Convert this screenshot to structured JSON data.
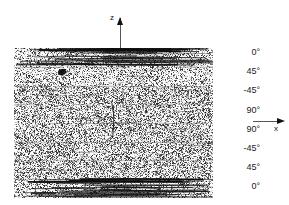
{
  "figure": {
    "kind": "optical-micrograph",
    "background_color": "#ffffff",
    "ink_color": "#111111"
  },
  "micrograph": {
    "left": 14,
    "top": 48,
    "width": 199,
    "height": 150,
    "description": "Speckled cross-section of a fibre-reinforced laminate showing stacked plies; dark horizontal fibre streaks in the outer 0-degree bands, fine random speckle through the interior, faint horizontal ply interfaces, a vertical transverse crack near the centre and a dark void near the upper left.",
    "features": [
      {
        "name": "void-upper-left",
        "x": 62,
        "y": 72,
        "width": 8,
        "height": 6
      },
      {
        "name": "transverse-crack",
        "x": 112,
        "y": 103,
        "width": 2,
        "height": 34
      },
      {
        "name": "micro-crack-lower-centre",
        "x": 130,
        "y": 127,
        "width": 2,
        "height": 8
      }
    ],
    "ply_interfaces_y": [
      0,
      19,
      38,
      56,
      75,
      94,
      112,
      131,
      150
    ],
    "fibre_band_rows": [
      0,
      1,
      7
    ]
  },
  "ply_labels": {
    "items": [
      {
        "label": "0°",
        "y": 52
      },
      {
        "label": "45°",
        "y": 71
      },
      {
        "label": "-45°",
        "y": 90
      },
      {
        "label": "90°",
        "y": 110
      },
      {
        "label": "90°",
        "y": 129
      },
      {
        "label": "-45°",
        "y": 148
      },
      {
        "label": "45°",
        "y": 167
      },
      {
        "label": "0°",
        "y": 186
      }
    ]
  },
  "axes": {
    "z": {
      "name": "z",
      "direction": "up"
    },
    "x": {
      "name": "x",
      "direction": "right"
    }
  }
}
